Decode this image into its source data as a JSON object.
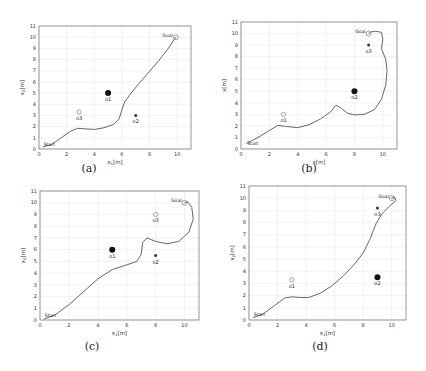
{
  "chart_data": [
    {
      "id": "a",
      "type": "line",
      "caption": "(a)",
      "xlabel": "x1[m]",
      "ylabel": "x2[m]",
      "xlabel_main": "x",
      "xlabel_sub": "1",
      "xlabel_unit": "[m]",
      "ylabel_main": "x",
      "ylabel_sub": "2",
      "ylabel_unit": "[m]",
      "xlim": [
        0,
        11
      ],
      "ylim": [
        0,
        11
      ],
      "xticks": [
        0,
        2,
        4,
        6,
        8,
        10
      ],
      "yticks": [
        0,
        1,
        2,
        3,
        4,
        5,
        6,
        7,
        8,
        9,
        10,
        11
      ],
      "grid": true,
      "start": {
        "label": "Start",
        "x": 0.3,
        "y": 0.25
      },
      "goal": {
        "label": "Goal",
        "x": 9.9,
        "y": 10.0
      },
      "obstacles": [
        {
          "label": "o1",
          "x": 5.0,
          "y": 5.0,
          "size": "large",
          "color": "#111111"
        },
        {
          "label": "o2",
          "x": 7.0,
          "y": 3.0,
          "size": "small",
          "color": "#333333"
        },
        {
          "label": "o3",
          "x": 2.9,
          "y": 3.3,
          "size": "small-open",
          "color": "#999999"
        }
      ],
      "path": [
        [
          0.3,
          0.2
        ],
        [
          0.9,
          0.4
        ],
        [
          1.6,
          1.0
        ],
        [
          2.3,
          1.6
        ],
        [
          2.8,
          1.85
        ],
        [
          3.3,
          1.8
        ],
        [
          4.0,
          1.75
        ],
        [
          4.7,
          1.9
        ],
        [
          5.4,
          2.2
        ],
        [
          5.8,
          2.7
        ],
        [
          6.0,
          3.5
        ],
        [
          6.2,
          4.2
        ],
        [
          6.6,
          4.9
        ],
        [
          7.2,
          5.8
        ],
        [
          7.9,
          6.8
        ],
        [
          8.6,
          7.8
        ],
        [
          9.3,
          8.9
        ],
        [
          9.9,
          10.0
        ]
      ]
    },
    {
      "id": "b",
      "type": "line",
      "caption": "(b)",
      "xlabel": "x[m]",
      "ylabel": "x[m]",
      "xlabel_main": "x",
      "xlabel_sub": "",
      "xlabel_unit": "[m]",
      "ylabel_main": "x",
      "ylabel_sub": "",
      "ylabel_unit": "[m]",
      "xlim": [
        0,
        11
      ],
      "ylim": [
        0,
        11
      ],
      "xticks": [
        0,
        2,
        4,
        6,
        8,
        10
      ],
      "yticks": [
        0,
        1,
        2,
        3,
        4,
        5,
        6,
        7,
        8,
        9,
        10,
        11
      ],
      "grid": true,
      "start": {
        "label": "Start",
        "x": 0.4,
        "y": 0.3
      },
      "goal": {
        "label": "Goal",
        "x": 9.0,
        "y": 10.0
      },
      "obstacles": [
        {
          "label": "o1",
          "x": 3.0,
          "y": 3.0,
          "size": "small-open",
          "color": "#999999"
        },
        {
          "label": "o2",
          "x": 8.0,
          "y": 5.0,
          "size": "large",
          "color": "#111111"
        },
        {
          "label": "o3",
          "x": 9.0,
          "y": 9.0,
          "size": "small",
          "color": "#333333"
        }
      ],
      "path": [
        [
          0.4,
          0.5
        ],
        [
          1.2,
          1.0
        ],
        [
          2.0,
          1.6
        ],
        [
          2.6,
          2.05
        ],
        [
          3.2,
          1.95
        ],
        [
          4.0,
          1.85
        ],
        [
          4.8,
          2.1
        ],
        [
          5.6,
          2.6
        ],
        [
          6.3,
          3.2
        ],
        [
          6.7,
          3.8
        ],
        [
          7.1,
          3.5
        ],
        [
          7.5,
          3.1
        ],
        [
          8.0,
          2.95
        ],
        [
          8.7,
          3.0
        ],
        [
          9.4,
          3.4
        ],
        [
          9.9,
          4.3
        ],
        [
          10.2,
          5.5
        ],
        [
          10.3,
          6.8
        ],
        [
          10.2,
          7.8
        ],
        [
          9.9,
          8.7
        ],
        [
          10.0,
          9.5
        ],
        [
          9.9,
          10.1
        ],
        [
          9.5,
          10.2
        ],
        [
          9.2,
          10.15
        ],
        [
          9.0,
          10.0
        ]
      ]
    },
    {
      "id": "c",
      "type": "line",
      "caption": "(c)",
      "xlabel": "x1[m]",
      "ylabel": "x2[m]",
      "xlabel_main": "x",
      "xlabel_sub": "1",
      "xlabel_unit": "[m]",
      "ylabel_main": "x",
      "ylabel_sub": "2",
      "ylabel_unit": "[m]",
      "xlim": [
        0,
        11
      ],
      "ylim": [
        0,
        11
      ],
      "xticks": [
        0,
        2,
        4,
        6,
        8,
        10
      ],
      "yticks": [
        0,
        1,
        2,
        3,
        4,
        5,
        6,
        7,
        8,
        9,
        10,
        11
      ],
      "grid": true,
      "start": {
        "label": "Start",
        "x": 0.3,
        "y": 0.2
      },
      "goal": {
        "label": "Goal",
        "x": 10.0,
        "y": 10.0
      },
      "obstacles": [
        {
          "label": "o1",
          "x": 5.0,
          "y": 6.0,
          "size": "large",
          "color": "#111111"
        },
        {
          "label": "o2",
          "x": 8.0,
          "y": 5.5,
          "size": "small",
          "color": "#333333"
        },
        {
          "label": "o3",
          "x": 8.0,
          "y": 9.0,
          "size": "small-open",
          "color": "#999999"
        }
      ],
      "path": [
        [
          0.3,
          0.1
        ],
        [
          1.0,
          0.4
        ],
        [
          2.0,
          1.3
        ],
        [
          3.0,
          2.4
        ],
        [
          4.0,
          3.5
        ],
        [
          5.0,
          4.3
        ],
        [
          6.0,
          4.7
        ],
        [
          6.7,
          5.0
        ],
        [
          7.0,
          5.6
        ],
        [
          7.1,
          6.6
        ],
        [
          7.4,
          7.0
        ],
        [
          8.0,
          6.7
        ],
        [
          8.8,
          6.5
        ],
        [
          9.6,
          6.7
        ],
        [
          10.3,
          7.5
        ],
        [
          10.6,
          8.6
        ],
        [
          10.5,
          9.6
        ],
        [
          10.2,
          10.1
        ],
        [
          10.0,
          10.0
        ]
      ]
    },
    {
      "id": "d",
      "type": "line",
      "caption": "(d)",
      "xlabel": "x1[m]",
      "ylabel": "x2[m]",
      "xlabel_main": "x",
      "xlabel_sub": "1",
      "xlabel_unit": "[m]",
      "ylabel_main": "x",
      "ylabel_sub": "2",
      "ylabel_unit": "[m]",
      "xlim": [
        0,
        11
      ],
      "ylim": [
        0,
        11
      ],
      "xticks": [
        0,
        2,
        4,
        6,
        8,
        10
      ],
      "yticks": [
        0,
        1,
        2,
        3,
        4,
        5,
        6,
        7,
        8,
        9,
        10,
        11
      ],
      "grid": true,
      "start": {
        "label": "Start",
        "x": 0.3,
        "y": 0.25
      },
      "goal": {
        "label": "Goal",
        "x": 10.0,
        "y": 10.0
      },
      "obstacles": [
        {
          "label": "o1",
          "x": 3.0,
          "y": 3.3,
          "size": "small-open",
          "color": "#999999"
        },
        {
          "label": "o2",
          "x": 9.0,
          "y": 3.5,
          "size": "large",
          "color": "#111111"
        },
        {
          "label": "o3",
          "x": 9.0,
          "y": 9.2,
          "size": "small",
          "color": "#333333"
        }
      ],
      "path": [
        [
          0.3,
          0.2
        ],
        [
          1.0,
          0.5
        ],
        [
          1.8,
          1.2
        ],
        [
          2.5,
          1.8
        ],
        [
          3.0,
          1.9
        ],
        [
          3.6,
          1.85
        ],
        [
          4.2,
          1.85
        ],
        [
          5.0,
          2.2
        ],
        [
          5.8,
          2.8
        ],
        [
          6.6,
          3.6
        ],
        [
          7.4,
          4.6
        ],
        [
          8.0,
          5.5
        ],
        [
          8.5,
          6.7
        ],
        [
          8.9,
          7.9
        ],
        [
          9.3,
          8.7
        ],
        [
          9.8,
          9.3
        ],
        [
          10.3,
          9.8
        ],
        [
          10.2,
          10.1
        ],
        [
          10.0,
          10.0
        ]
      ]
    }
  ]
}
